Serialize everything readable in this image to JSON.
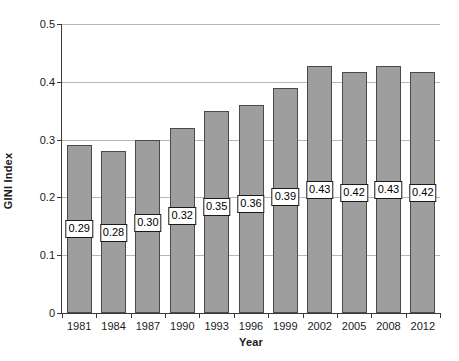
{
  "chart_data": {
    "type": "bar",
    "title": "",
    "xlabel": "Year",
    "ylabel": "GINI Index",
    "categories": [
      "1981",
      "1984",
      "1987",
      "1990",
      "1993",
      "1996",
      "1999",
      "2002",
      "2005",
      "2008",
      "2012"
    ],
    "values": [
      0.29,
      0.28,
      0.3,
      0.32,
      0.35,
      0.36,
      0.39,
      0.427,
      0.417,
      0.427,
      0.417
    ],
    "data_labels": [
      "0.29",
      "0.28",
      "0.30",
      "0.32",
      "0.35",
      "0.36",
      "0.39",
      "0.43",
      "0.42",
      "0.43",
      "0.42"
    ],
    "label_positions": [
      0.145,
      0.138,
      0.155,
      0.168,
      0.183,
      0.188,
      0.2,
      0.213,
      0.208,
      0.213,
      0.208
    ],
    "ylim": [
      0,
      0.5
    ],
    "yticks": [
      0,
      0.1,
      0.2,
      0.3,
      0.4,
      0.5
    ],
    "ytick_labels": [
      "0",
      "0.1",
      "0.2",
      "0.3",
      "0.4",
      "0.5"
    ],
    "grid": true,
    "gridlines_at": [
      0.1,
      0.2,
      0.3,
      0.4,
      0.5
    ],
    "legend": "none",
    "bar_color": "#9e9e9e",
    "bar_border_color": "#4a4a4a",
    "gridline_color": "#b7b7b7",
    "axis_color": "#3a3a3a"
  }
}
